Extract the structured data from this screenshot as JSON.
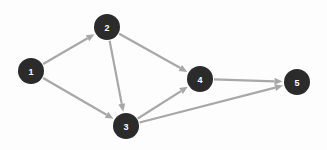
{
  "figure": {
    "width": 327,
    "height": 150,
    "background_color": "#fdfdfd"
  },
  "style": {
    "node_fill": "#2b2b2b",
    "node_radius": 13,
    "node_label_color": "#ffffff",
    "node_label_font_size": 9,
    "edge_color": "#a8a8a8",
    "edge_width": 2.2,
    "arrow_color": "#a8a8a8",
    "arrow_length": 8,
    "arrow_width": 7
  },
  "chart_data": {
    "type": "diagram",
    "diagram_type": "directed-graph",
    "directed": true,
    "node_count": 5,
    "edge_count": 7,
    "nodes": [
      {
        "id": "1",
        "label": "1",
        "x": 31,
        "y": 71
      },
      {
        "id": "2",
        "label": "2",
        "x": 107,
        "y": 27
      },
      {
        "id": "3",
        "label": "3",
        "x": 126,
        "y": 126
      },
      {
        "id": "4",
        "label": "4",
        "x": 200,
        "y": 79
      },
      {
        "id": "5",
        "label": "5",
        "x": 297,
        "y": 82
      }
    ],
    "edges": [
      {
        "source": "1",
        "target": "2",
        "directed": true
      },
      {
        "source": "1",
        "target": "3",
        "directed": true
      },
      {
        "source": "2",
        "target": "3",
        "directed": true
      },
      {
        "source": "2",
        "target": "4",
        "directed": true
      },
      {
        "source": "3",
        "target": "4",
        "directed": true
      },
      {
        "source": "3",
        "target": "5",
        "directed": true
      },
      {
        "source": "4",
        "target": "5",
        "directed": true
      }
    ],
    "adjacency": {
      "1": [
        "2",
        "3"
      ],
      "2": [
        "3",
        "4"
      ],
      "3": [
        "4",
        "5"
      ],
      "4": [
        "5"
      ],
      "5": []
    },
    "in_degree": {
      "1": 0,
      "2": 1,
      "3": 2,
      "4": 2,
      "5": 2
    },
    "out_degree": {
      "1": 2,
      "2": 2,
      "3": 2,
      "4": 1,
      "5": 0
    }
  }
}
